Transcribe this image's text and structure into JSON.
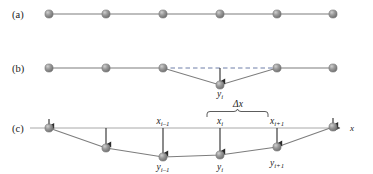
{
  "figure": {
    "colors": {
      "node_fill": "#8f8f8f",
      "node_highlight": "#c9c9c9",
      "node_edge": "#6e6e6e",
      "line": "#7d7d7d",
      "axis": "#a8a8a8",
      "dashed": "#6f7fa8",
      "arrow": "#2b2b2b",
      "brace": "#4a4a4a",
      "text": "#1a1a1a"
    }
  },
  "panels": [
    {
      "id": "a",
      "label": "(a)",
      "description": "equally spaced nodes on a straight horizontal line",
      "baseline_y": 14,
      "node_count": 6,
      "nodes": [
        {
          "x": 49,
          "y": 14
        },
        {
          "x": 106,
          "y": 14
        },
        {
          "x": 163,
          "y": 14
        },
        {
          "x": 220,
          "y": 14
        },
        {
          "x": 277,
          "y": 14
        },
        {
          "x": 333,
          "y": 14
        }
      ],
      "annotations": []
    },
    {
      "id": "b",
      "label": "(b)",
      "description": "single interior node displaced downward, dashed chord shows original position",
      "baseline_y": 68,
      "node_count": 6,
      "nodes": [
        {
          "x": 49,
          "y": 68
        },
        {
          "x": 106,
          "y": 68
        },
        {
          "x": 163,
          "y": 68
        },
        {
          "x": 220,
          "y": 85
        },
        {
          "x": 277,
          "y": 68
        },
        {
          "x": 333,
          "y": 68
        }
      ],
      "dashed_chord": {
        "x1": 163,
        "y1": 68,
        "x2": 277,
        "y2": 68
      },
      "arrow": {
        "x": 220,
        "y1": 68,
        "y2": 83
      },
      "annotations": [
        {
          "name": "y-i-label",
          "base": "y",
          "sub": "i",
          "x": 220,
          "y": 96
        }
      ]
    },
    {
      "id": "c",
      "label": "(c)",
      "description": "all interior nodes displaced downward forming a sagging curve, with x axis, node coordinate labels and spacing brace",
      "baseline_y": 128,
      "node_count": 6,
      "nodes": [
        {
          "x": 49,
          "y": 128
        },
        {
          "x": 106,
          "y": 148
        },
        {
          "x": 163,
          "y": 157
        },
        {
          "x": 220,
          "y": 155
        },
        {
          "x": 277,
          "y": 147
        },
        {
          "x": 333,
          "y": 127
        }
      ],
      "axis": {
        "x1": 30,
        "x2": 343,
        "y": 128,
        "arrow_label": "x"
      },
      "arrows": [
        {
          "x": 49,
          "y1": 120,
          "y2": 128
        },
        {
          "x": 106,
          "y1": 128,
          "y2": 146
        },
        {
          "x": 163,
          "y1": 128,
          "y2": 155
        },
        {
          "x": 220,
          "y1": 128,
          "y2": 153
        },
        {
          "x": 277,
          "y1": 128,
          "y2": 145
        },
        {
          "x": 333,
          "y1": 119,
          "y2": 127
        }
      ],
      "brace": {
        "x1": 207,
        "x2": 268,
        "y": 112,
        "depth": 5
      },
      "annotations": [
        {
          "name": "delta-x-label",
          "base": "Δx",
          "sub": "",
          "x": 238,
          "y": 107
        },
        {
          "name": "x-i-minus-1-label",
          "base": "x",
          "sub": "i–1",
          "x": 163,
          "y": 124
        },
        {
          "name": "x-i-label",
          "base": "x",
          "sub": "i",
          "x": 220,
          "y": 124
        },
        {
          "name": "x-i-plus-1-label",
          "base": "x",
          "sub": "i+1",
          "x": 277,
          "y": 124
        },
        {
          "name": "y-i-minus-1-label",
          "base": "y",
          "sub": "i–1",
          "x": 163,
          "y": 170
        },
        {
          "name": "y-i-label",
          "base": "y",
          "sub": "i",
          "x": 220,
          "y": 170
        },
        {
          "name": "y-i-plus-1-label",
          "base": "y",
          "sub": "i+1",
          "x": 277,
          "y": 166
        }
      ]
    }
  ],
  "labels": {
    "panel_a": "(a)",
    "panel_b": "(b)",
    "panel_c": "(c)",
    "axis_x": "x",
    "delta_x": "Δx",
    "y_i": "y",
    "y_i_sub": "i",
    "y_im1": "y",
    "y_im1_sub": "i–1",
    "y_ip1": "y",
    "y_ip1_sub": "i+1",
    "x_im1": "x",
    "x_im1_sub": "i–1",
    "x_i": "x",
    "x_i_sub": "i",
    "x_ip1": "x",
    "x_ip1_sub": "i+1"
  }
}
